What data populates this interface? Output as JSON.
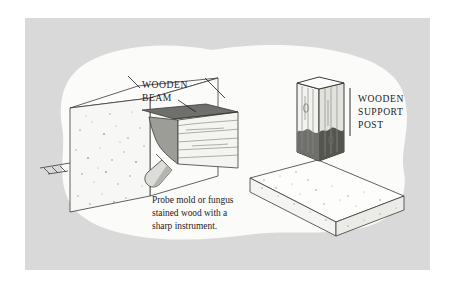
{
  "figure": {
    "type": "technical-illustration",
    "panel": {
      "background_color": "#d9d9d9",
      "inner_blob_color": "#fbfbfa",
      "outer_margin_color": "#ffffff"
    },
    "palette": {
      "ink": "#1c1c1c",
      "outline": "#3a3a3a",
      "concrete_face_light": "#fdfdfc",
      "concrete_face_mid": "#f2f2f0",
      "concrete_face_shadow": "#e4e4e1",
      "concrete_speckle": "#9a9a96",
      "wood_light": "#f4f4f1",
      "wood_mid": "#e2e2de",
      "wood_grain": "#8d8d88",
      "rot_stain_dark": "#6f6f6b",
      "rot_stain_mid": "#9d9d98",
      "probe_body": "#dcdcd8",
      "probe_shadow": "#b5b5b0"
    }
  },
  "labels": {
    "beam": {
      "lines": [
        "WOODEN",
        "BEAM"
      ],
      "line1": "WOODEN",
      "line2": "BEAM"
    },
    "post": {
      "lines": [
        "WOODEN",
        "SUPPORT",
        "POST"
      ],
      "line1": "WOODEN",
      "line2": "SUPPORT",
      "line3": "POST"
    }
  },
  "caption": {
    "lines": [
      "Probe mold or fungus",
      "stained wood with a",
      "sharp instrument."
    ],
    "line1": "Probe mold or fungus",
    "line2": "stained wood with a",
    "line3": "sharp instrument."
  },
  "scene_left": {
    "name": "foundation-wall-and-beam",
    "elements": [
      "concrete-foundation-wall",
      "grade-line",
      "wooden-beam",
      "beam-rot-stain",
      "probe-instrument"
    ]
  },
  "scene_right": {
    "name": "support-post-on-footing",
    "elements": [
      "concrete-footing-slab",
      "wooden-support-post",
      "post-rot-stain",
      "post-knots"
    ]
  }
}
